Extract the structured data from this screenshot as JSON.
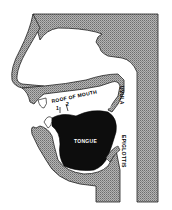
{
  "diagram": {
    "labels": {
      "roof_of_mouth": "ROOF OF MOUTH",
      "marker_1": "1",
      "marker_2": "2",
      "uvula": "UVULA",
      "epiglottis": "EPIGLOTTIS",
      "tongue": "TONGUE"
    },
    "colors": {
      "tissue": "#a9a9a9",
      "tissue_dot": "#7a7a7a",
      "tongue": "#0d0d0d",
      "airway": "#ffffff",
      "outline": "#222222"
    }
  }
}
